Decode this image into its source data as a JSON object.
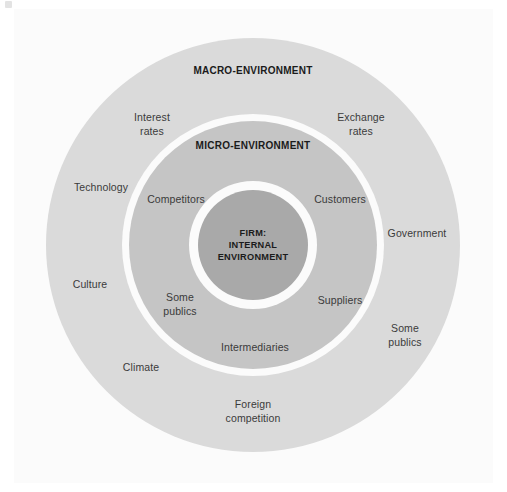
{
  "diagram": {
    "rings": [
      {
        "id": "macro",
        "heading": "MACRO-ENVIRONMENT",
        "color": "#dadada",
        "labels": [
          "Interest\nrates",
          "Exchange\nrates",
          "Technology",
          "Government",
          "Culture",
          "Some\npublics",
          "Climate",
          "Foreign\ncompetition"
        ]
      },
      {
        "id": "micro",
        "heading": "MICRO-ENVIRONMENT",
        "color": "#c5c5c5",
        "labels": [
          "Competitors",
          "Customers",
          "Some\npublics",
          "Suppliers",
          "Intermediaries"
        ]
      },
      {
        "id": "firm",
        "heading": "FIRM:\nINTERNAL\nENVIRONMENT",
        "color": "#a9a9a9",
        "labels": []
      }
    ],
    "colors": {
      "panel_background": "#fbfbfb",
      "macro_ring": "#dadada",
      "micro_ring": "#c5c5c5",
      "firm_circle": "#a9a9a9",
      "separator": "#fbfbfb",
      "label_text": "#3a3a3a",
      "heading_text": "#1b1b1b"
    }
  }
}
